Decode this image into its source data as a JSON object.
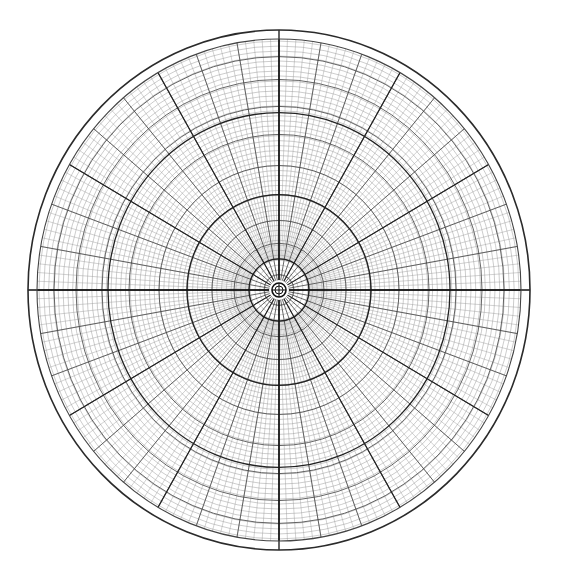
{
  "canvas": {
    "width": 561,
    "height": 581,
    "background": "#ffffff"
  },
  "polar_grid": {
    "center": {
      "x": 279,
      "y": 290
    },
    "outer_border": {
      "rx": 251,
      "ry": 260,
      "stroke": "#2a2a2a",
      "width": 1.6
    },
    "grid_radius": {
      "rx": 242,
      "ry": 251
    },
    "hub": {
      "r_outer": 7,
      "r_inner": 4,
      "stroke": "#111111"
    },
    "rings": {
      "fine_step": 4.8,
      "fine_color": "#9a9a9a",
      "fine_width": 0.5,
      "major_radii": [
        15,
        30,
        45,
        67,
        92,
        120,
        150,
        177,
        203,
        225
      ],
      "major_color": "#555555",
      "major_width": 0.9,
      "dark_radii": [
        30,
        92,
        171
      ],
      "dark_color": "#222222",
      "dark_width": 1.3
    },
    "spokes": {
      "fine_step_deg": 2,
      "fine_start_r": 30,
      "fine_color": "#9a9a9a",
      "fine_width": 0.45,
      "medium_step_deg": 10,
      "medium_start_r": 7,
      "medium_color": "#444444",
      "medium_width": 0.8,
      "major_step_deg": 30,
      "major_color": "#222222",
      "major_width": 1.1,
      "axis_color": "#111111",
      "axis_width": 1.3
    }
  }
}
